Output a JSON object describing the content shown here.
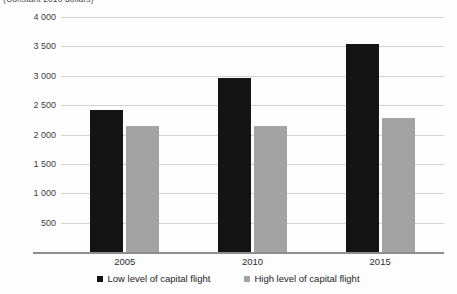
{
  "subtitle": "(Constant 2010 dollars)",
  "chart_data": {
    "type": "bar",
    "title": "",
    "subtitle": "(Constant 2010 dollars)",
    "xlabel": "",
    "ylabel": "",
    "categories": [
      "2005",
      "2010",
      "2015"
    ],
    "series": [
      {
        "name": "Low level of capital flight",
        "color": "#141414",
        "values": [
          2420,
          2955,
          3545
        ]
      },
      {
        "name": "High level of capital flight",
        "color": "#a3a3a3",
        "values": [
          2150,
          2145,
          2285
        ]
      }
    ],
    "ylim": [
      0,
      4000
    ],
    "yticks": [
      500,
      1000,
      1500,
      2000,
      2500,
      3000,
      3500,
      4000
    ],
    "ytick_labels": [
      "500",
      "1 000",
      "1 500",
      "2 000",
      "2 500",
      "3 000",
      "3 500",
      "4 000"
    ],
    "grid": true,
    "legend_position": "bottom"
  },
  "legend": {
    "items": [
      {
        "label": "Low level of capital flight",
        "color": "#141414"
      },
      {
        "label": "High level of capital flight",
        "color": "#a3a3a3"
      }
    ]
  }
}
